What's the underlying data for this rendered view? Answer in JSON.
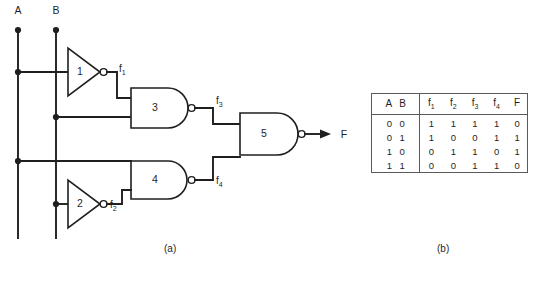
{
  "figure": {
    "caption_a": "(a)",
    "caption_b": "(b)"
  },
  "circuit": {
    "inputs": [
      {
        "name": "A",
        "label": "A"
      },
      {
        "name": "B",
        "label": "B"
      }
    ],
    "output": {
      "name": "F",
      "label": "F"
    },
    "gates": [
      {
        "id": "1",
        "label": "1",
        "type": "inverter"
      },
      {
        "id": "2",
        "label": "2",
        "type": "inverter"
      },
      {
        "id": "3",
        "label": "3",
        "type": "nand"
      },
      {
        "id": "4",
        "label": "4",
        "type": "nand"
      },
      {
        "id": "5",
        "label": "5",
        "type": "nand"
      }
    ],
    "signals": [
      {
        "name": "f1",
        "base": "f",
        "sub": "1"
      },
      {
        "name": "f2",
        "base": "f",
        "sub": "2"
      },
      {
        "name": "f3",
        "base": "f",
        "sub": "3"
      },
      {
        "name": "f4",
        "base": "f",
        "sub": "4"
      }
    ],
    "colors": {
      "wire": "#1f1f1f",
      "gate_fill": "#ffffff",
      "background": "#ffffff"
    }
  },
  "truth_table": {
    "input_header": "A B",
    "headers": [
      {
        "base": "f",
        "sub": "1"
      },
      {
        "base": "f",
        "sub": "2"
      },
      {
        "base": "f",
        "sub": "3"
      },
      {
        "base": "f",
        "sub": "4"
      },
      {
        "base": "F",
        "sub": ""
      }
    ],
    "rows": [
      {
        "inputs": "0 0",
        "values": [
          "1",
          "1",
          "1",
          "1",
          "0"
        ]
      },
      {
        "inputs": "0 1",
        "values": [
          "1",
          "0",
          "0",
          "1",
          "1"
        ]
      },
      {
        "inputs": "1 0",
        "values": [
          "0",
          "1",
          "1",
          "0",
          "1"
        ]
      },
      {
        "inputs": "1 1",
        "values": [
          "0",
          "0",
          "1",
          "1",
          "0"
        ]
      }
    ]
  }
}
